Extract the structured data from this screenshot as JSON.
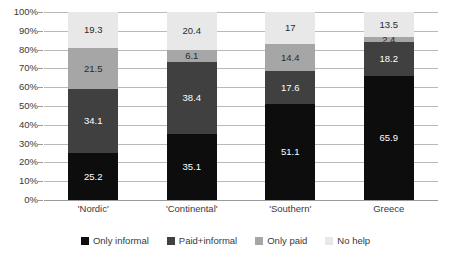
{
  "chart_data": {
    "type": "bar",
    "variant": "stacked-100-percent",
    "title": "",
    "xlabel": "",
    "ylabel": "",
    "ylim": [
      0,
      100
    ],
    "ytick_labels": [
      "100%",
      "90%",
      "80%",
      "70%",
      "60%",
      "50%",
      "40%",
      "30%",
      "20%",
      "10%",
      "0%"
    ],
    "ytick_values": [
      100,
      90,
      80,
      70,
      60,
      50,
      40,
      30,
      20,
      10,
      0
    ],
    "grid": "horizontal",
    "legend_position": "bottom",
    "categories": [
      "'Nordic'",
      "'Continental'",
      "'Southern'",
      "Greece"
    ],
    "series": [
      {
        "name": "Only informal",
        "color": "#0d0d0d",
        "label_color": "#ffffff",
        "values": [
          25.2,
          35.1,
          51.1,
          65.9
        ],
        "labels": [
          "25.2",
          "35.1",
          "51.1",
          "65.9"
        ]
      },
      {
        "name": "Paid+informal",
        "color": "#404040",
        "label_color": "#ffffff",
        "values": [
          34.1,
          38.4,
          17.6,
          18.2
        ],
        "labels": [
          "34.1",
          "38.4",
          "17.6",
          "18.2"
        ]
      },
      {
        "name": "Only paid",
        "color": "#a6a6a6",
        "label_color": "#2b2b2b",
        "values": [
          21.5,
          6.1,
          14.4,
          2.4
        ],
        "labels": [
          "21.5",
          "6.1",
          "14.4",
          "2.4"
        ]
      },
      {
        "name": "No help",
        "color": "#e8e8e8",
        "label_color": "#2b2b2b",
        "values": [
          19.3,
          20.4,
          17.0,
          13.5
        ],
        "labels": [
          "19.3",
          "20.4",
          "17",
          "13.5"
        ]
      }
    ]
  },
  "legend": {
    "items": [
      {
        "label": "Only informal",
        "color": "#0d0d0d"
      },
      {
        "label": "Paid+informal",
        "color": "#404040"
      },
      {
        "label": "Only paid",
        "color": "#a6a6a6"
      },
      {
        "label": "No help",
        "color": "#e8e8e8"
      }
    ]
  }
}
